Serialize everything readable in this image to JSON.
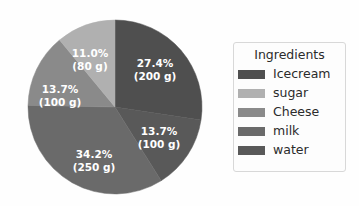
{
  "chart_data": {
    "type": "pie",
    "title": "",
    "legend_title": "Ingredients",
    "legend_position": "right",
    "start_angle_deg": 90,
    "direction": "clockwise",
    "total_grams": 730,
    "units": "g",
    "categories": [
      "Icecream",
      "sugar",
      "Cheese",
      "milk",
      "water"
    ],
    "values": [
      200,
      80,
      100,
      250,
      100
    ],
    "percentages": [
      27.4,
      11.0,
      13.7,
      34.2,
      13.7
    ],
    "colors": [
      "#4f4f4f",
      "#b0b0b0",
      "#8a8a8a",
      "#6a6a6a",
      "#595959"
    ],
    "slices": [
      {
        "name": "Icecream",
        "percent": 27.4,
        "grams": 200,
        "color": "#4f4f4f",
        "label_pct": "27.4%",
        "label_amt": "(200 g)",
        "label_x": 155,
        "label_y": 64,
        "start_deg": 90,
        "end_deg": 1.36
      },
      {
        "name": "water",
        "percent": 13.7,
        "grams": 100,
        "color": "#595959",
        "label_pct": "13.7%",
        "label_amt": "(100 g)",
        "label_x": 159,
        "label_y": 132,
        "start_deg": 1.36,
        "end_deg": -47.96
      },
      {
        "name": "milk",
        "percent": 34.2,
        "grams": 250,
        "color": "#6a6a6a",
        "label_pct": "34.2%",
        "label_amt": "(250 g)",
        "label_x": 94,
        "label_y": 155,
        "start_deg": -47.96,
        "end_deg": -171.08
      },
      {
        "name": "Cheese",
        "percent": 13.7,
        "grams": 100,
        "color": "#8a8a8a",
        "label_pct": "13.7%",
        "label_amt": "(100 g)",
        "label_x": 60,
        "label_y": 90,
        "start_deg": -171.08,
        "end_deg": -220.4
      },
      {
        "name": "sugar",
        "percent": 11.0,
        "grams": 80,
        "color": "#b0b0b0",
        "label_pct": "11.0%",
        "label_amt": "(80 g)",
        "label_x": 90,
        "label_y": 54,
        "start_deg": -220.4,
        "end_deg": -260.0
      }
    ],
    "geometry": {
      "center_x": 115,
      "center_y": 107,
      "radius": 87
    }
  },
  "legend": {
    "title": "Ingredients",
    "items": [
      {
        "label": "Icecream",
        "color": "#4f4f4f"
      },
      {
        "label": "sugar",
        "color": "#b0b0b0"
      },
      {
        "label": "Cheese",
        "color": "#8a8a8a"
      },
      {
        "label": "milk",
        "color": "#6a6a6a"
      },
      {
        "label": "water",
        "color": "#595959"
      }
    ]
  }
}
